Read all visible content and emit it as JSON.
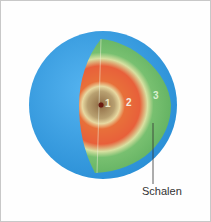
{
  "diagram": {
    "layers": [
      {
        "id": "1",
        "label": "1",
        "color": "#f0e9c8"
      },
      {
        "id": "2",
        "label": "2",
        "color": "#f4ece0"
      },
      {
        "id": "3",
        "label": "3",
        "color": "#d9f0d0"
      }
    ],
    "caption": "Schalen",
    "colors": {
      "sphere": "#3a9ee0",
      "outer_shell": "#6bbf6a",
      "middle_shell": "#e8623a",
      "core": "#a89060",
      "nucleus": "#7a2a1a"
    }
  }
}
